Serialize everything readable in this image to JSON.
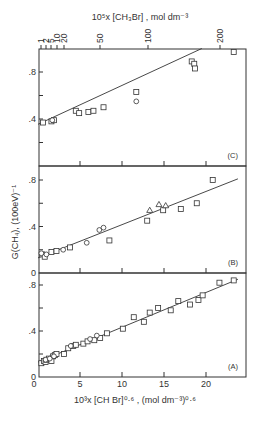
{
  "chart_data": {
    "type": "scatter",
    "layout": "three vertically stacked panels sharing the bottom x-axis",
    "ylabel": "G(CH4), (100eV)^-1",
    "xlabel": "10^3 x [CH Br]^0.6 , (mol dm^-3)^0.6",
    "top_axis": {
      "label": "10^5 x [CH3Br] , mol dm^-3",
      "ticks": [
        "1",
        "2",
        "5",
        "10",
        "20",
        "50",
        "100",
        "200"
      ],
      "tick_px": [
        41,
        46,
        51,
        57,
        64,
        100,
        148,
        220
      ]
    },
    "x_ticks": [
      0,
      5,
      10,
      15,
      20
    ],
    "x_tick_labels": [
      "5",
      "10",
      "15",
      "20"
    ],
    "xlim": [
      0,
      24.5
    ],
    "panels": [
      {
        "label": "(C)",
        "ylim": [
          0,
          1.0
        ],
        "y_ticks": [
          0,
          0.4,
          0.8
        ],
        "y_tick_labels": [
          "",
          ".4",
          ".8"
        ],
        "fit_line": {
          "x": [
            0,
            19.5
          ],
          "y": [
            0.355,
            1.0
          ]
        },
        "series": [
          {
            "name": "squares",
            "marker": "square",
            "x": [
              0.6,
              1.6,
              1.9,
              4.5,
              4.9,
              6.0,
              6.6,
              7.8,
              11.7,
              18.3,
              18.6,
              18.7,
              23.3
            ],
            "y": [
              0.37,
              0.38,
              0.39,
              0.47,
              0.45,
              0.46,
              0.47,
              0.5,
              0.63,
              0.89,
              0.87,
              0.83,
              0.97
            ]
          },
          {
            "name": "circles",
            "marker": "circle",
            "x": [
              1.7,
              11.7
            ],
            "y": [
              0.39,
              0.55
            ]
          }
        ]
      },
      {
        "label": "(B)",
        "ylim": [
          0,
          0.93
        ],
        "y_ticks": [
          0,
          0.4,
          0.8
        ],
        "y_tick_labels": [
          "0",
          ".4",
          ".8"
        ],
        "fit_line": {
          "x": [
            0,
            23.8
          ],
          "y": [
            0.13,
            0.81
          ]
        },
        "series": [
          {
            "name": "squares",
            "marker": "square",
            "x": [
              0.5,
              0.8,
              1.6,
              2.2,
              3.8,
              8.5,
              13.0,
              14.9,
              17.0,
              18.9,
              20.8
            ],
            "y": [
              0.16,
              0.14,
              0.18,
              0.19,
              0.22,
              0.28,
              0.45,
              0.54,
              0.55,
              0.6,
              0.8
            ]
          },
          {
            "name": "circles",
            "marker": "circle",
            "x": [
              0.4,
              1.0,
              3.0,
              5.8,
              7.3,
              7.8
            ],
            "y": [
              0.17,
              0.16,
              0.2,
              0.26,
              0.37,
              0.39
            ]
          },
          {
            "name": "triangles",
            "marker": "triangle",
            "x": [
              13.3,
              14.4,
              15.2
            ],
            "y": [
              0.54,
              0.59,
              0.58
            ]
          }
        ]
      },
      {
        "label": "(A)",
        "ylim": [
          0,
          0.93
        ],
        "y_ticks": [
          0,
          0.4,
          0.8
        ],
        "y_tick_labels": [
          "0",
          ".4",
          ".8"
        ],
        "fit_line": {
          "x": [
            0,
            23.8
          ],
          "y": [
            0.13,
            0.85
          ]
        },
        "series": [
          {
            "name": "squares",
            "marker": "square",
            "x": [
              0.4,
              0.7,
              0.9,
              1.0,
              1.3,
              1.6,
              1.8,
              2.0,
              2.2,
              3.1,
              3.6,
              4.2,
              4.5,
              5.4,
              5.9,
              6.7,
              7.4,
              8.2,
              10.1,
              11.4,
              12.6,
              13.3,
              14.3,
              15.8,
              16.7,
              18.1,
              19.1,
              19.6,
              21.6,
              23.3
            ],
            "y": [
              0.12,
              0.14,
              0.13,
              0.15,
              0.16,
              0.14,
              0.18,
              0.19,
              0.2,
              0.2,
              0.25,
              0.27,
              0.28,
              0.29,
              0.31,
              0.32,
              0.34,
              0.38,
              0.42,
              0.52,
              0.48,
              0.56,
              0.6,
              0.58,
              0.66,
              0.63,
              0.67,
              0.71,
              0.82,
              0.84
            ]
          },
          {
            "name": "circles",
            "marker": "circle",
            "x": [
              0.9,
              1.4,
              1.9,
              3.9,
              6.2,
              7.0
            ],
            "y": [
              0.15,
              0.16,
              0.18,
              0.27,
              0.33,
              0.36
            ]
          }
        ]
      }
    ],
    "grid": false
  }
}
